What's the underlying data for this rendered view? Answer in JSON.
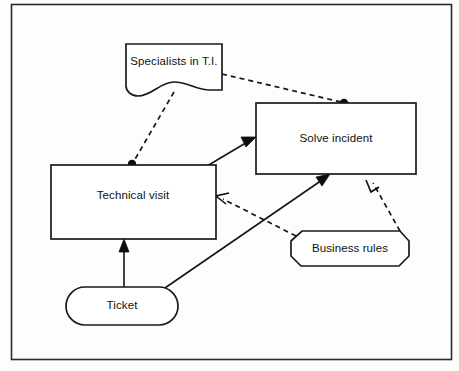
{
  "diagram": {
    "background_color": "#fdfdfd",
    "frame": {
      "name": "diagram-border",
      "stroke_color": "#2b2b2b"
    },
    "nodes": [
      {
        "id": "specialists",
        "label": "Specialists in T.I.",
        "shape": "document-wavy-bottom",
        "x": 126,
        "y": 44,
        "width": 96,
        "height": 46,
        "label_x": 174,
        "label_y": 62
      },
      {
        "id": "solve-incident",
        "label": "Solve incident",
        "shape": "rectangle",
        "x": 256,
        "y": 103,
        "width": 160,
        "height": 71,
        "label_x": 336,
        "label_y": 139
      },
      {
        "id": "technical-visit",
        "label": "Technical visit",
        "shape": "rectangle",
        "x": 51,
        "y": 165,
        "width": 165,
        "height": 74,
        "label_x": 133,
        "label_y": 196
      },
      {
        "id": "business-rules",
        "label": "Business rules",
        "shape": "hexagon",
        "x": 291,
        "y": 231,
        "width": 118,
        "height": 35,
        "label_x": 350,
        "label_y": 249
      },
      {
        "id": "ticket",
        "label": "Ticket",
        "shape": "stadium",
        "x": 66,
        "y": 287,
        "width": 112,
        "height": 38,
        "label_x": 122,
        "label_y": 306
      }
    ],
    "connectors": [
      {
        "id": "specialists-to-solve-incident",
        "from": "specialists",
        "to": "solve-incident",
        "style": "dashed",
        "terminator": "filled-dot"
      },
      {
        "id": "specialists-to-technical-visit",
        "from": "specialists",
        "to": "technical-visit",
        "style": "dashed",
        "terminator": "filled-dot"
      },
      {
        "id": "technical-visit-to-solve-incident",
        "from": "technical-visit",
        "to": "solve-incident",
        "style": "solid",
        "terminator": "filled-arrow"
      },
      {
        "id": "business-rules-to-technical-visit",
        "from": "business-rules",
        "to": "technical-visit",
        "style": "dashed",
        "terminator": "open-arrow"
      },
      {
        "id": "business-rules-to-solve-incident",
        "from": "business-rules",
        "to": "solve-incident",
        "style": "dashed",
        "terminator": "open-arrow"
      },
      {
        "id": "ticket-to-technical-visit",
        "from": "ticket",
        "to": "technical-visit",
        "style": "solid",
        "terminator": "filled-arrow"
      },
      {
        "id": "ticket-to-solve-incident",
        "from": "ticket",
        "to": "solve-incident",
        "style": "solid",
        "terminator": "filled-arrow"
      }
    ]
  }
}
